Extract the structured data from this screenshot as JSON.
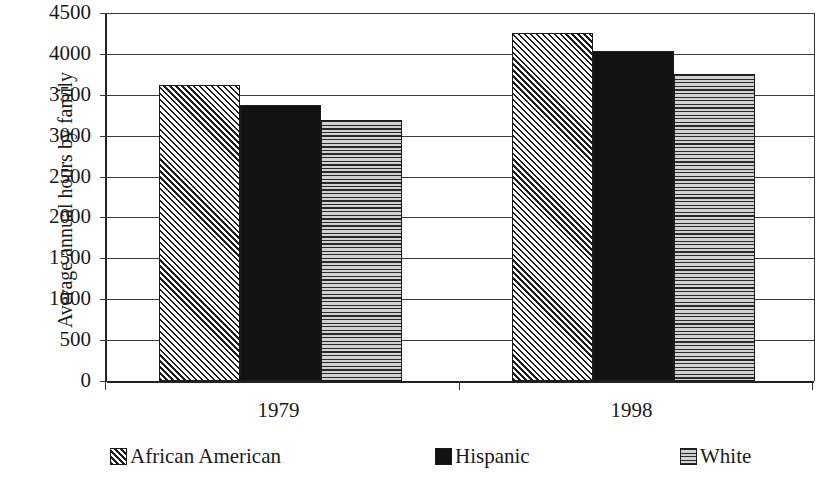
{
  "chart_data": {
    "type": "bar",
    "title": "",
    "subtitle": "",
    "xlabel": "",
    "ylabel": "Average annual hours by family",
    "categories": [
      "1979",
      "1998"
    ],
    "series": [
      {
        "name": "African American",
        "pattern": "diagonal-hatch",
        "values": [
          3620,
          4260
        ]
      },
      {
        "name": "Hispanic",
        "pattern": "solid-black",
        "values": [
          3370,
          4040
        ]
      },
      {
        "name": "White",
        "pattern": "horizontal-lines",
        "values": [
          3190,
          3760
        ]
      }
    ],
    "ylim": [
      0,
      4500
    ],
    "ytick_step": 500,
    "yticks": [
      0,
      500,
      1000,
      1500,
      2000,
      2500,
      3000,
      3500,
      4000,
      4500
    ],
    "ytick_labels": [
      "0",
      "500",
      "1000",
      "1500",
      "2000",
      "2500",
      "3000",
      "3500",
      "4000",
      "4500"
    ],
    "grid": true,
    "grid_axis": "y",
    "legend_position": "bottom",
    "colors": {
      "axis": "#222222",
      "grid": "#3a3a3a",
      "hatch_fill": "#f2f2f2",
      "solid_fill": "#121212",
      "horiz_fill": "#e8e8e8",
      "text": "#1a1a1a",
      "background": "#ffffff"
    }
  },
  "axis": {
    "y_title": "Average annual hours by family"
  },
  "legend": {
    "items": [
      {
        "label": "African American"
      },
      {
        "label": "Hispanic"
      },
      {
        "label": "White"
      }
    ]
  }
}
